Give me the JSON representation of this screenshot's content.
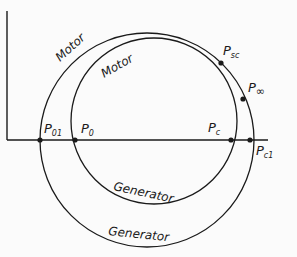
{
  "diagram": {
    "type": "circle-diagram",
    "axes": {
      "horizontal": true,
      "vertical": true
    },
    "circles": [
      {
        "id": "outer",
        "upper_label": "Motor",
        "lower_label": "Generator",
        "points": [
          "P01",
          "Psc",
          "Pc1"
        ]
      },
      {
        "id": "inner",
        "upper_label": "Motor",
        "lower_label": "Generator",
        "points": [
          "P0",
          "P∞",
          "Pc"
        ]
      }
    ],
    "points": {
      "p01": {
        "main": "P",
        "sub": "01"
      },
      "p0": {
        "main": "P",
        "sub": "0"
      },
      "psc": {
        "main": "P",
        "sub": "sc"
      },
      "pinf": {
        "main": "P",
        "sub": "∞"
      },
      "pc": {
        "main": "P",
        "sub": "c"
      },
      "pc1": {
        "main": "P",
        "sub": "c1"
      }
    },
    "labels": {
      "outer_motor": "Motor",
      "inner_motor": "Motor",
      "inner_generator": "Generator",
      "outer_generator": "Generator"
    },
    "colors": {
      "line": "#1a1a1a",
      "background": "#fbfbfb"
    }
  }
}
